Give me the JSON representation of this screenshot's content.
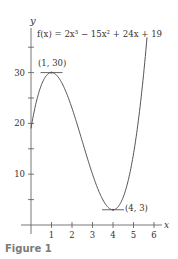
{
  "chart_data": {
    "type": "line",
    "title": "f(x) = 2x³ − 15x² + 24x + 19",
    "function": {
      "a": 2,
      "b": -15,
      "c": 24,
      "d": 19
    },
    "xlabel": "x",
    "ylabel": "y",
    "xlim": [
      -0.5,
      6.5
    ],
    "ylim": [
      -2,
      38
    ],
    "x_ticks": [
      1,
      2,
      3,
      4,
      5,
      6
    ],
    "y_ticks": [
      5,
      10,
      15,
      20,
      25,
      30,
      35
    ],
    "y_tick_labels": {
      "10": "10",
      "20": "20",
      "30": "30"
    },
    "curve_domain": [
      0,
      5.66
    ],
    "points": [
      {
        "x": 0,
        "y": 19
      },
      {
        "x": 1,
        "y": 30
      },
      {
        "x": 2,
        "y": 23
      },
      {
        "x": 3,
        "y": 10
      },
      {
        "x": 4,
        "y": 3
      },
      {
        "x": 5,
        "y": 14
      },
      {
        "x": 5.66,
        "y": 35.6
      }
    ],
    "annotations": [
      {
        "label": "(1, 30)",
        "x": 1,
        "y": 30,
        "type": "local-maximum"
      },
      {
        "label": "(4, 3)",
        "x": 4,
        "y": 3,
        "type": "local-minimum"
      }
    ],
    "grid": false,
    "legend": null
  },
  "figure": {
    "caption": "Figure 1",
    "equation": "f(x) = 2x³ − 15x² + 24x + 19",
    "axis_x_label": "x",
    "axis_y_label": "y",
    "max_label": "(1, 30)",
    "min_label": "(4, 3)"
  }
}
